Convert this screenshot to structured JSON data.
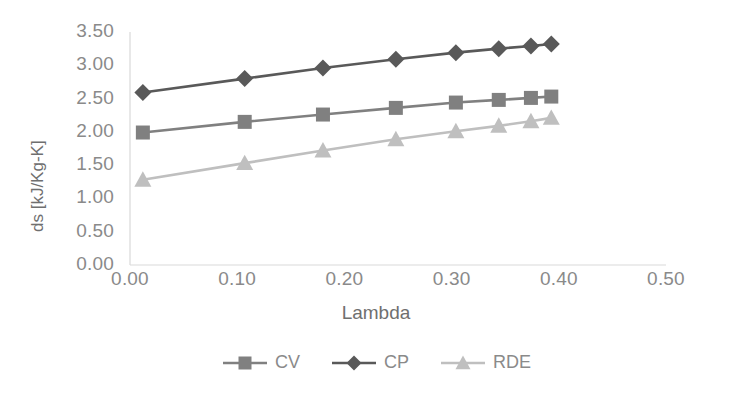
{
  "chart_data": {
    "type": "line",
    "title": "",
    "xlabel": "Lambda",
    "ylabel": "ds [kJ/Kg-K]",
    "xlim": [
      0.0,
      0.5
    ],
    "ylim": [
      0.0,
      3.5
    ],
    "xticks": [
      "0.00",
      "0.10",
      "0.20",
      "0.30",
      "0.40",
      "0.50"
    ],
    "xtick_values": [
      0.0,
      0.1,
      0.2,
      0.3,
      0.4,
      0.5
    ],
    "yticks": [
      "0.00",
      "0.50",
      "1.00",
      "1.50",
      "2.00",
      "2.50",
      "3.00",
      "3.50"
    ],
    "ytick_values": [
      0.0,
      0.5,
      1.0,
      1.5,
      2.0,
      2.5,
      3.0,
      3.5
    ],
    "grid": false,
    "legend_position": "bottom",
    "x": [
      0.012,
      0.107,
      0.18,
      0.248,
      0.304,
      0.344,
      0.374,
      0.393
    ],
    "series": [
      {
        "name": "CV",
        "marker": "square",
        "color": "#808080",
        "values": [
          1.99,
          2.15,
          2.26,
          2.36,
          2.44,
          2.48,
          2.51,
          2.53
        ]
      },
      {
        "name": "CP",
        "marker": "diamond",
        "color": "#595959",
        "values": [
          2.59,
          2.8,
          2.96,
          3.09,
          3.19,
          3.25,
          3.29,
          3.32
        ]
      },
      {
        "name": "RDE",
        "marker": "triangle",
        "color": "#bfbfbf",
        "values": [
          1.28,
          1.53,
          1.72,
          1.89,
          2.01,
          2.09,
          2.16,
          2.21
        ]
      }
    ]
  },
  "legend": {
    "items": [
      {
        "label": "CV"
      },
      {
        "label": "CP"
      },
      {
        "label": "RDE"
      }
    ]
  },
  "axes": {
    "axis_color": "#d9d9d9",
    "tick_text_color": "#8a8a8a"
  }
}
